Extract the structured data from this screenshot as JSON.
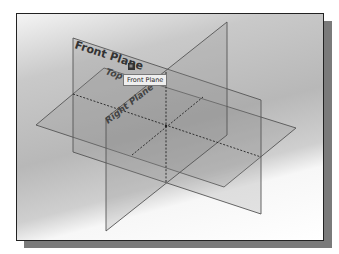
{
  "figure": {
    "type": "3D datum planes isometric view",
    "planes": [
      {
        "name": "front",
        "label": "Front Plane"
      },
      {
        "name": "top",
        "label": "Top"
      },
      {
        "name": "right",
        "label": "Right Plane"
      }
    ],
    "tooltip": "Front Plane",
    "colors": {
      "plane_edge": "#555555",
      "plane_fill": "#8a8a8a",
      "label": "#333333",
      "shadow": "#7a7a7a"
    }
  }
}
